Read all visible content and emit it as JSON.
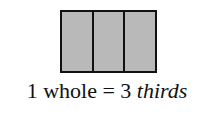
{
  "diagram": {
    "parts": 3,
    "fill_color": "#b9b9b9",
    "border_color": "#111111",
    "caption": {
      "number_left": "1",
      "word_left": "whole",
      "equals": "=",
      "number_right": "3",
      "word_right": "thirds"
    }
  }
}
